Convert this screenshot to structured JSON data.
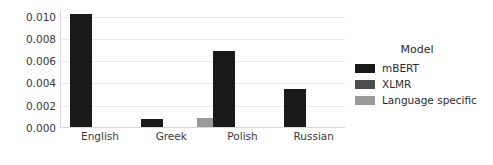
{
  "chart_data": {
    "type": "bar",
    "title": "",
    "xlabel": "",
    "ylabel": "",
    "categories": [
      "English",
      "Greek",
      "Polish",
      "Russian"
    ],
    "series": [
      {
        "name": "mBERT",
        "color": "#1a1a1a",
        "values": [
          0.0102,
          0.0008,
          0.0069,
          0.0035
        ]
      },
      {
        "name": "XLMR",
        "color": "#4d4d4d",
        "values": [
          null,
          null,
          null,
          null
        ]
      },
      {
        "name": "Language specific",
        "color": "#9a9a9a",
        "values": [
          null,
          0.0009,
          null,
          null
        ]
      }
    ],
    "ylim": [
      0.0,
      0.0105
    ],
    "yticks": [
      0.0,
      0.002,
      0.004,
      0.006,
      0.008,
      0.01
    ],
    "ytick_labels": [
      "0.000",
      "0.002",
      "0.004",
      "0.006",
      "0.008",
      "0.010"
    ],
    "grid": true,
    "grid_axis": "y",
    "legend": {
      "title": "Model",
      "position": "right",
      "entries": [
        {
          "label": "mBERT",
          "color": "#1a1a1a"
        },
        {
          "label": "XLMR",
          "color": "#4d4d4d"
        },
        {
          "label": "Language specific",
          "color": "#9a9a9a"
        }
      ]
    },
    "colors": {
      "background": "#ffffff",
      "grid": "#e9e9ee",
      "axis": "#d8d8de",
      "text": "#39393d"
    }
  }
}
